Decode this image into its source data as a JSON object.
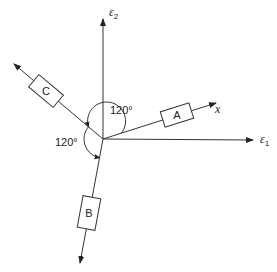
{
  "diagram": {
    "axes": {
      "e1": {
        "symbol": "ε",
        "subscript": "1"
      },
      "e2": {
        "symbol": "ε",
        "subscript": "2"
      },
      "x": {
        "label": "x"
      }
    },
    "gauges": [
      {
        "id": "A",
        "label": "A"
      },
      {
        "id": "B",
        "label": "B"
      },
      {
        "id": "C",
        "label": "C"
      }
    ],
    "angles": [
      {
        "label": "120°"
      },
      {
        "label": "120°"
      }
    ],
    "colors": {
      "stroke": "#333333",
      "background": "#ffffff"
    }
  }
}
